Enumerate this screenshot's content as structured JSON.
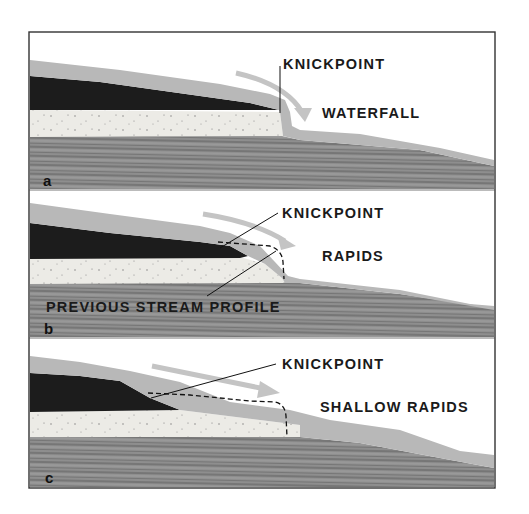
{
  "figure": {
    "colors": {
      "frame": "#333333",
      "water_gray": "#b8b8b8",
      "resistant_layer": "#1c1c1c",
      "sandstone": "#ecebe6",
      "bedrock": "#8c8c8c",
      "bedrock_stripe": "#5e5e5e",
      "arrow": "#c4c4c4",
      "leader_line": "#111111",
      "dashed_profile": "#111111"
    },
    "panels": [
      {
        "letter": "a",
        "knickpoint_label": "KNICKPOINT",
        "feature_label": "WATERFALL"
      },
      {
        "letter": "b",
        "knickpoint_label": "KNICKPOINT",
        "feature_label": "RAPIDS",
        "profile_label": "PREVIOUS STREAM PROFILE"
      },
      {
        "letter": "c",
        "knickpoint_label": "KNICKPOINT",
        "feature_label": "SHALLOW RAPIDS"
      }
    ]
  }
}
